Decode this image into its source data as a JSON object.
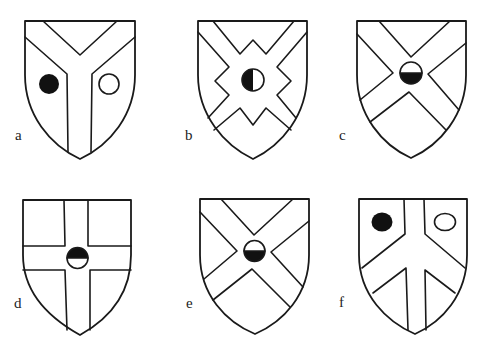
{
  "figure": {
    "shields": [
      {
        "id": "a",
        "label": "a",
        "ordinary": "pall (Y-shape)",
        "charges": [
          "black roundel (left)",
          "white roundel (right)"
        ]
      },
      {
        "id": "b",
        "label": "b",
        "ordinary": "saltire with indented center",
        "charges": [
          "roundel per pale black and white (center)"
        ]
      },
      {
        "id": "c",
        "label": "c",
        "ordinary": "saltire",
        "charges": [
          "roundel per fess white over black (center)"
        ]
      },
      {
        "id": "d",
        "label": "d",
        "ordinary": "cross",
        "charges": [
          "roundel per fess black over white (center)"
        ]
      },
      {
        "id": "e",
        "label": "e",
        "ordinary": "saltire",
        "charges": [
          "roundel per fess white over black (center)"
        ]
      },
      {
        "id": "f",
        "label": "f",
        "ordinary": "pall reversed with pale",
        "charges": [
          "black roundel (upper left)",
          "white roundel (upper right)"
        ]
      }
    ]
  },
  "colors": {
    "line": "#1a1a1a",
    "fill": "#ffffff",
    "black_tincture": "#111111"
  }
}
